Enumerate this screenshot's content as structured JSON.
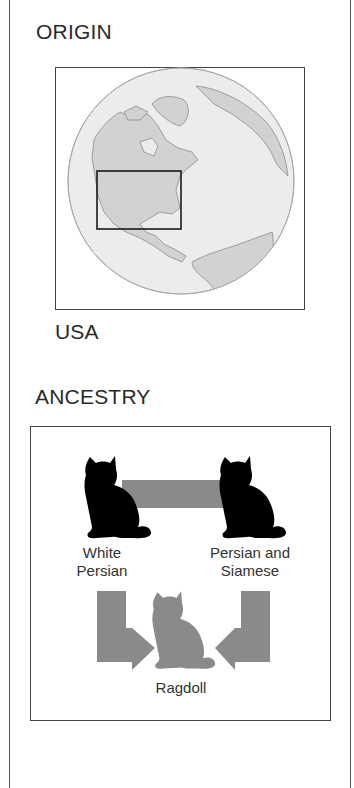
{
  "origin": {
    "heading": "ORIGIN",
    "country": "USA",
    "map": {
      "highlight": "USA region",
      "icon": "globe-icon"
    }
  },
  "ancestry": {
    "heading": "ANCESTRY",
    "parents": [
      {
        "label_line1": "White",
        "label_line2": "Persian",
        "icon": "cat-silhouette-icon"
      },
      {
        "label_line1": "Persian and",
        "label_line2": "Siamese",
        "icon": "cat-silhouette-icon"
      }
    ],
    "offspring": {
      "label": "Ragdoll",
      "icon": "cat-silhouette-icon"
    }
  },
  "colors": {
    "parent_cat": "#000000",
    "offspring_cat": "#8a8a8a",
    "arrow": "#8a8a8a",
    "land": "#d4d4d4",
    "ocean": "#ececec"
  }
}
